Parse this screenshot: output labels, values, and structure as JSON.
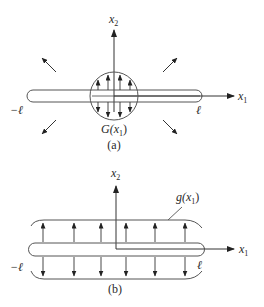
{
  "figure_a": {
    "axis_x1": {
      "label": "x",
      "sub": "1"
    },
    "axis_x2": {
      "label": "x",
      "sub": "2"
    },
    "left_end": "−ℓ",
    "right_end": "ℓ",
    "region_label": {
      "func": "G(",
      "var": "x",
      "sub": "1",
      "close": ")"
    },
    "caption": "(a)"
  },
  "figure_b": {
    "axis_x1": {
      "label": "x",
      "sub": "1"
    },
    "axis_x2": {
      "label": "x",
      "sub": "2"
    },
    "left_end": "−ℓ",
    "right_end": "ℓ",
    "region_label": {
      "func": "g(",
      "var": "x",
      "sub": "1",
      "close": ")"
    },
    "caption": "(b)"
  },
  "colors": {
    "stroke": "#333333",
    "text": "#2a2a2a"
  }
}
